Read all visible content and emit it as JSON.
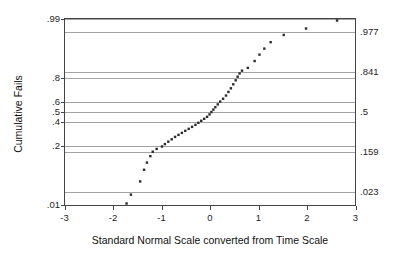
{
  "chart_data": {
    "type": "scatter",
    "title": "",
    "xlabel": "Standard Normal Scale converted from Time Scale",
    "ylabel": "Cumulative Fails",
    "xlim": [
      -3,
      3
    ],
    "ylim": [
      -2.33,
      2.33
    ],
    "grid": true,
    "legend": null,
    "xticks": [
      -3,
      -2,
      -1,
      0,
      1,
      2,
      3
    ],
    "xtick_labels": [
      "-3",
      "-2",
      "-1",
      "0",
      "1",
      "2",
      "3"
    ],
    "left_axis": {
      "name": "Cumulative probability",
      "tick_values": [
        0.99,
        0.8,
        0.6,
        0.5,
        0.4,
        0.2,
        0.01
      ],
      "tick_labels": [
        ".99",
        ".8",
        ".6",
        ".5",
        ".4",
        ".2",
        ".01"
      ],
      "tick_z": [
        2.326,
        0.842,
        0.253,
        0.0,
        -0.253,
        -0.842,
        -2.326
      ]
    },
    "right_axis": {
      "name": "Normal cumulative probability at integer z",
      "tick_values": [
        0.977,
        0.841,
        0.5,
        0.159,
        0.023
      ],
      "tick_labels": [
        ".977",
        ".841",
        ".5",
        ".159",
        ".023"
      ],
      "tick_z": [
        2.0,
        1.0,
        0.0,
        -1.0,
        -2.0
      ]
    },
    "gridlines_z": [
      2.326,
      2.0,
      1.0,
      0.842,
      0.253,
      0.0,
      -0.253,
      -0.842,
      -1.0,
      -2.0,
      -2.326
    ],
    "series": [
      {
        "name": "Cumulative failure points",
        "marker": "square",
        "color": "#2b2b2b",
        "n_points": 45,
        "points": [
          {
            "x": -1.72,
            "z": -2.28
          },
          {
            "x": -1.63,
            "z": -2.06
          },
          {
            "x": -1.44,
            "z": -1.73
          },
          {
            "x": -1.36,
            "z": -1.44
          },
          {
            "x": -1.3,
            "z": -1.26
          },
          {
            "x": -1.23,
            "z": -1.1
          },
          {
            "x": -1.18,
            "z": -0.99
          },
          {
            "x": -1.1,
            "z": -0.92
          },
          {
            "x": -0.99,
            "z": -0.86
          },
          {
            "x": -0.93,
            "z": -0.8
          },
          {
            "x": -0.86,
            "z": -0.74
          },
          {
            "x": -0.79,
            "z": -0.68
          },
          {
            "x": -0.72,
            "z": -0.62
          },
          {
            "x": -0.65,
            "z": -0.57
          },
          {
            "x": -0.58,
            "z": -0.52
          },
          {
            "x": -0.51,
            "z": -0.47
          },
          {
            "x": -0.44,
            "z": -0.42
          },
          {
            "x": -0.37,
            "z": -0.37
          },
          {
            "x": -0.3,
            "z": -0.32
          },
          {
            "x": -0.24,
            "z": -0.27
          },
          {
            "x": -0.18,
            "z": -0.22
          },
          {
            "x": -0.12,
            "z": -0.17
          },
          {
            "x": -0.06,
            "z": -0.12
          },
          {
            "x": -0.01,
            "z": -0.06
          },
          {
            "x": 0.03,
            "z": 0.0
          },
          {
            "x": 0.07,
            "z": 0.06
          },
          {
            "x": 0.11,
            "z": 0.12
          },
          {
            "x": 0.16,
            "z": 0.19
          },
          {
            "x": 0.21,
            "z": 0.26
          },
          {
            "x": 0.27,
            "z": 0.33
          },
          {
            "x": 0.33,
            "z": 0.41
          },
          {
            "x": 0.38,
            "z": 0.5
          },
          {
            "x": 0.43,
            "z": 0.59
          },
          {
            "x": 0.48,
            "z": 0.69
          },
          {
            "x": 0.53,
            "z": 0.79
          },
          {
            "x": 0.57,
            "z": 0.88
          },
          {
            "x": 0.61,
            "z": 0.96
          },
          {
            "x": 0.66,
            "z": 1.03
          },
          {
            "x": 0.78,
            "z": 1.1
          },
          {
            "x": 0.92,
            "z": 1.27
          },
          {
            "x": 1.02,
            "z": 1.43
          },
          {
            "x": 1.12,
            "z": 1.58
          },
          {
            "x": 1.25,
            "z": 1.74
          },
          {
            "x": 1.52,
            "z": 1.92
          },
          {
            "x": 1.98,
            "z": 2.08
          },
          {
            "x": 2.62,
            "z": 2.28
          }
        ]
      }
    ]
  }
}
